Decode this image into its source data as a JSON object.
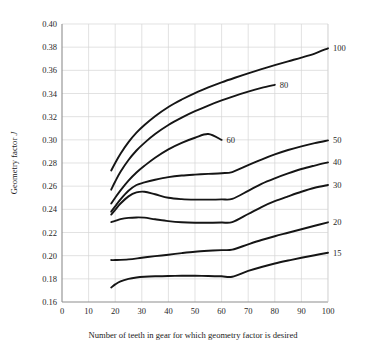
{
  "chart_data": {
    "type": "line",
    "title": "",
    "xlabel": "Number of teeth in gear for which geometry factor is desired",
    "ylabel": "Geometry factor J",
    "ylabel_plain": "Geometry factor",
    "ylabel_italic": "J",
    "xlim": [
      0,
      100
    ],
    "ylim": [
      0.16,
      0.4
    ],
    "xticks": [
      0,
      10,
      20,
      30,
      40,
      50,
      60,
      70,
      80,
      90,
      100
    ],
    "xtick_labels": [
      "0",
      "10",
      "20",
      "30",
      "40",
      "50",
      "60",
      "70",
      "80",
      "90",
      "100"
    ],
    "yticks": [
      0.16,
      0.18,
      0.2,
      0.22,
      0.24,
      0.26,
      0.28,
      0.3,
      0.32,
      0.34,
      0.36,
      0.38,
      0.4
    ],
    "ytick_labels": [
      "0.16",
      "0.18",
      "0.20",
      "0.22",
      "0.24",
      "0.26",
      "0.28",
      "0.30",
      "0.32",
      "0.34",
      "0.36",
      "0.38",
      "0.40"
    ],
    "grid": true,
    "legend": "inline-end-labels",
    "curve_label_note": "Number of teeth in mating gear",
    "series": [
      {
        "name": "100",
        "label": "100",
        "label_position": "right-edge",
        "x": [
          18.5,
          20,
          22,
          25,
          28,
          31,
          35,
          40,
          45,
          50,
          55,
          60,
          65,
          70,
          75,
          80,
          85,
          90,
          95,
          100
        ],
        "y": [
          0.2735,
          0.28,
          0.288,
          0.298,
          0.3062,
          0.3128,
          0.3204,
          0.3284,
          0.3348,
          0.3404,
          0.3452,
          0.3496,
          0.3536,
          0.3574,
          0.361,
          0.3645,
          0.3678,
          0.371,
          0.3745,
          0.379
        ]
      },
      {
        "name": "80",
        "label": "80",
        "label_position": "inline",
        "x": [
          18.5,
          20,
          22,
          25,
          28,
          31,
          35,
          40,
          45,
          50,
          55,
          60,
          65,
          70,
          75,
          80
        ],
        "y": [
          0.257,
          0.264,
          0.2724,
          0.2826,
          0.2908,
          0.2974,
          0.305,
          0.3128,
          0.3192,
          0.3248,
          0.3296,
          0.334,
          0.338,
          0.3416,
          0.3448,
          0.3475
        ]
      },
      {
        "name": "60",
        "label": "60",
        "label_position": "inline",
        "x": [
          18.5,
          20,
          22,
          25,
          28,
          31,
          35,
          40,
          45,
          50,
          55,
          60
        ],
        "y": [
          0.245,
          0.25,
          0.2564,
          0.2648,
          0.2718,
          0.2776,
          0.2846,
          0.2918,
          0.2974,
          0.3018,
          0.305,
          0.3
        ]
      },
      {
        "name": "50",
        "label": "50",
        "label_position": "right-edge",
        "x": [
          18.5,
          20,
          22,
          25,
          28,
          31,
          35,
          40,
          45,
          50,
          55,
          60,
          64,
          70,
          75,
          80,
          85,
          90,
          95,
          100
        ],
        "y": [
          0.238,
          0.2426,
          0.2486,
          0.256,
          0.261,
          0.2632,
          0.2655,
          0.2678,
          0.2692,
          0.27,
          0.2706,
          0.2712,
          0.2722,
          0.2782,
          0.283,
          0.2874,
          0.2912,
          0.2944,
          0.2972,
          0.2995
        ]
      },
      {
        "name": "40",
        "label": "40",
        "label_position": "right-edge",
        "x": [
          18.5,
          20,
          22,
          25,
          28,
          31,
          35,
          40,
          45,
          50,
          55,
          60,
          64,
          70,
          75,
          80,
          85,
          90,
          95,
          100
        ],
        "y": [
          0.2355,
          0.2396,
          0.245,
          0.2512,
          0.2546,
          0.2552,
          0.253,
          0.25,
          0.2488,
          0.2484,
          0.2484,
          0.2486,
          0.249,
          0.256,
          0.262,
          0.2668,
          0.271,
          0.2748,
          0.2778,
          0.2805
        ]
      },
      {
        "name": "30",
        "label": "30",
        "label_position": "right-edge",
        "x": [
          18.5,
          20,
          22,
          25,
          28,
          31,
          35,
          40,
          45,
          50,
          55,
          60,
          64,
          70,
          75,
          80,
          85,
          90,
          95,
          100
        ],
        "y": [
          0.229,
          0.23,
          0.2315,
          0.2326,
          0.233,
          0.2328,
          0.2314,
          0.2298,
          0.2288,
          0.2284,
          0.2284,
          0.2286,
          0.229,
          0.236,
          0.242,
          0.247,
          0.2512,
          0.2552,
          0.2586,
          0.261
        ]
      },
      {
        "name": "20",
        "label": "20",
        "label_position": "right-edge",
        "x": [
          18.5,
          20,
          25,
          30,
          35,
          40,
          45,
          50,
          55,
          60,
          64,
          70,
          75,
          80,
          85,
          90,
          95,
          100
        ],
        "y": [
          0.1962,
          0.1962,
          0.1968,
          0.1982,
          0.1996,
          0.2008,
          0.2022,
          0.2034,
          0.2042,
          0.2048,
          0.2052,
          0.2098,
          0.2135,
          0.2168,
          0.2198,
          0.2228,
          0.2258,
          0.2288
        ]
      },
      {
        "name": "15",
        "label": "15",
        "label_position": "right-edge",
        "x": [
          18.5,
          20,
          22,
          25,
          28,
          31,
          35,
          40,
          45,
          50,
          55,
          60,
          64,
          70,
          75,
          80,
          85,
          90,
          95,
          100
        ],
        "y": [
          0.1725,
          0.1752,
          0.1778,
          0.18,
          0.1812,
          0.1818,
          0.1822,
          0.1825,
          0.1826,
          0.1826,
          0.1825,
          0.1822,
          0.1818,
          0.1868,
          0.1902,
          0.1932,
          0.1958,
          0.1982,
          0.2004,
          0.2025
        ]
      }
    ],
    "colors": {
      "curve": "#151515",
      "grid": "#d6d6d6",
      "axis": "#8e8e8e",
      "text": "#1a1a1a",
      "background": "#ffffff"
    }
  }
}
